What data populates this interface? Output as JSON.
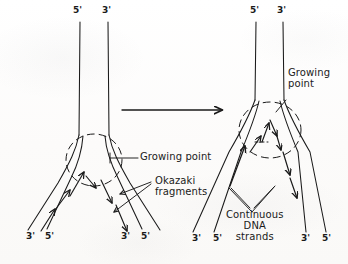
{
  "figure": {
    "background_color": "#fdfdfc",
    "ink_color": "#1a1a1a"
  },
  "transition_arrow": {
    "name": "progression-arrow",
    "direction": "right"
  },
  "panels": [
    {
      "id": "left",
      "name": "replication-fork-early",
      "top_labels": [
        {
          "text": "5'",
          "x": 76,
          "y": 9
        },
        {
          "text": "3'",
          "x": 104,
          "y": 9
        }
      ],
      "bottom_labels": [
        {
          "text": "3'",
          "x": 29,
          "y": 236
        },
        {
          "text": "5'",
          "x": 48,
          "y": 236
        },
        {
          "text": "3'",
          "x": 123,
          "y": 236
        },
        {
          "text": "5'",
          "x": 143,
          "y": 236
        }
      ],
      "annotations": [
        {
          "text": "Growing point",
          "x": 141,
          "y": 152
        },
        {
          "text": "Okazaki\nfragments",
          "line1": "Okazaki",
          "line2": "fragments",
          "x": 156,
          "y": 181
        }
      ]
    },
    {
      "id": "right",
      "name": "replication-fork-later",
      "top_labels": [
        {
          "text": "5'",
          "x": 252,
          "y": 9
        },
        {
          "text": "3'",
          "x": 279,
          "y": 9
        }
      ],
      "bottom_labels": [
        {
          "text": "3'",
          "x": 195,
          "y": 238
        },
        {
          "text": "5'",
          "x": 216,
          "y": 238
        },
        {
          "text": "3'",
          "x": 303,
          "y": 238
        },
        {
          "text": "5'",
          "x": 324,
          "y": 238
        }
      ],
      "annotations": [
        {
          "text": "Growing\npoint",
          "line1": "Growing",
          "line2": "point",
          "x": 289,
          "y": 73
        },
        {
          "text": "Continuous\nDNA\nstrands",
          "line1": "Continuous",
          "line2": "DNA",
          "line3": "strands",
          "x": 237,
          "y": 216
        }
      ]
    }
  ]
}
